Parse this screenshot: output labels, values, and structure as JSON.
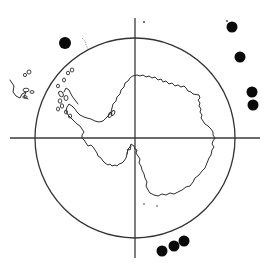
{
  "map": {
    "projection": "south-polar stereographic",
    "region": "Antarctica",
    "colors": {
      "ink": "#2e2e2e",
      "marker": "#0a0a0a",
      "background": "#ffffff"
    },
    "grid": {
      "center": [
        135,
        138
      ],
      "circle_radius": 100,
      "vertical_axis": {
        "x": 135,
        "y1": 18,
        "y2": 258
      },
      "horizontal_axis": {
        "y": 138,
        "x1": 10,
        "x2": 260
      }
    },
    "markers": [
      {
        "id": "site-1",
        "x": 65,
        "y": 43,
        "r": 6
      },
      {
        "id": "site-2",
        "x": 232,
        "y": 27,
        "r": 5.5
      },
      {
        "id": "site-3",
        "x": 240,
        "y": 57,
        "r": 5.5
      },
      {
        "id": "site-4",
        "x": 252,
        "y": 92,
        "r": 5.5
      },
      {
        "id": "site-5",
        "x": 253,
        "y": 105,
        "r": 5.5
      },
      {
        "id": "site-6",
        "x": 162,
        "y": 251,
        "r": 5.5
      },
      {
        "id": "site-7",
        "x": 174,
        "y": 246,
        "r": 5.5
      },
      {
        "id": "site-8",
        "x": 184,
        "y": 241,
        "r": 5.5
      }
    ]
  }
}
